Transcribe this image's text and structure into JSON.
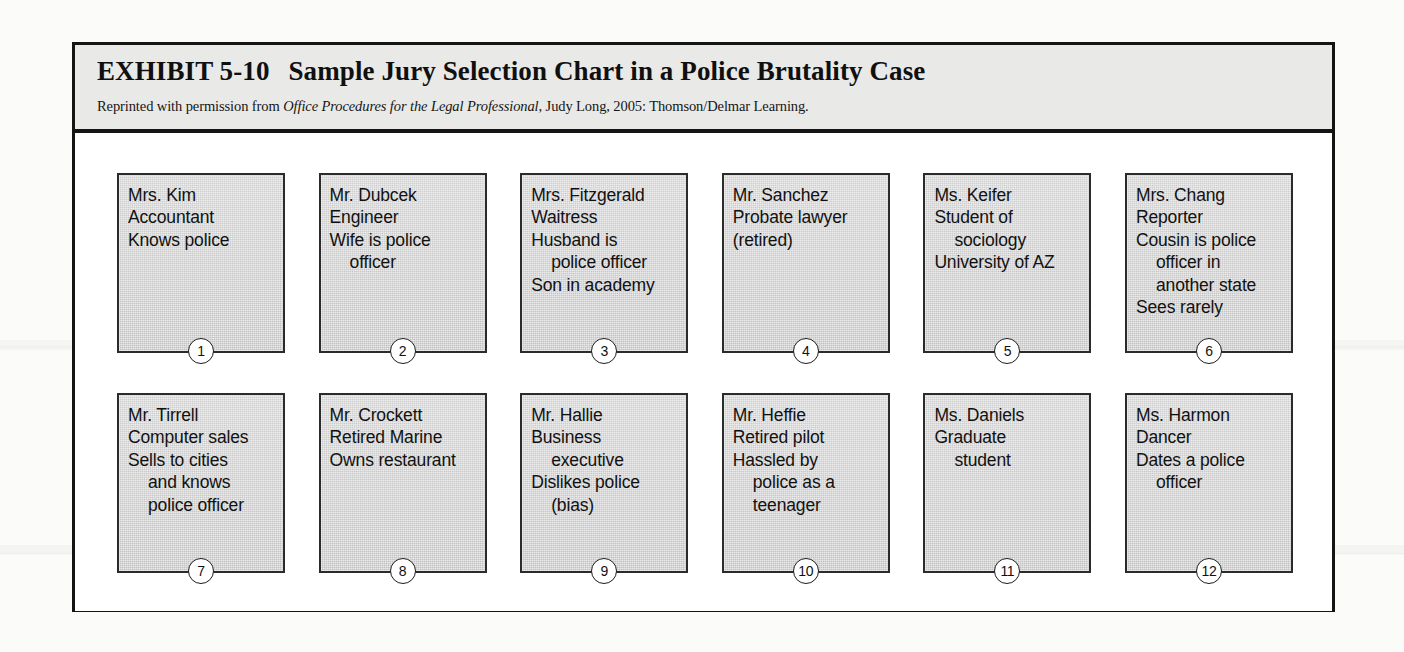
{
  "page": {
    "background_color": "#fbfbfa",
    "frame_color": "#141414"
  },
  "header": {
    "exhibit_number": "EXHIBIT 5-10",
    "title": "Sample Jury Selection Chart in a Police Brutality Case",
    "credit_prefix": "Reprinted with permission from ",
    "credit_book_title": "Office Procedures for the Legal Professional",
    "credit_suffix": ", Judy Long, 2005: Thomson/Delmar Learning.",
    "background_color": "#e9e9e7"
  },
  "chart_data": {
    "type": "table",
    "title": "Sample Jury Selection Chart in a Police Brutality Case",
    "layout": {
      "rows": 2,
      "columns": 6,
      "seat_count": 12
    },
    "cards": [
      {
        "number": "1",
        "lines": [
          {
            "text": "Mrs. Kim",
            "indent": false
          },
          {
            "text": "Accountant",
            "indent": false
          },
          {
            "text": "Knows police",
            "indent": false
          }
        ]
      },
      {
        "number": "2",
        "lines": [
          {
            "text": "Mr. Dubcek",
            "indent": false
          },
          {
            "text": "Engineer",
            "indent": false
          },
          {
            "text": "Wife is police",
            "indent": false
          },
          {
            "text": "officer",
            "indent": true
          }
        ]
      },
      {
        "number": "3",
        "lines": [
          {
            "text": "Mrs. Fitzgerald",
            "indent": false
          },
          {
            "text": "Waitress",
            "indent": false
          },
          {
            "text": "Husband is",
            "indent": false
          },
          {
            "text": "police officer",
            "indent": true
          },
          {
            "text": "Son in academy",
            "indent": false
          }
        ]
      },
      {
        "number": "4",
        "lines": [
          {
            "text": "Mr. Sanchez",
            "indent": false
          },
          {
            "text": "Probate lawyer",
            "indent": false
          },
          {
            "text": "(retired)",
            "indent": false
          }
        ]
      },
      {
        "number": "5",
        "lines": [
          {
            "text": "Ms. Keifer",
            "indent": false
          },
          {
            "text": "Student of",
            "indent": false
          },
          {
            "text": "sociology",
            "indent": true
          },
          {
            "text": "University of AZ",
            "indent": false
          }
        ]
      },
      {
        "number": "6",
        "lines": [
          {
            "text": "Mrs. Chang",
            "indent": false
          },
          {
            "text": "Reporter",
            "indent": false
          },
          {
            "text": "Cousin is police",
            "indent": false
          },
          {
            "text": "officer in",
            "indent": true
          },
          {
            "text": "another state",
            "indent": true
          },
          {
            "text": "Sees rarely",
            "indent": false
          }
        ]
      },
      {
        "number": "7",
        "lines": [
          {
            "text": "Mr. Tirrell",
            "indent": false
          },
          {
            "text": "Computer sales",
            "indent": false
          },
          {
            "text": "Sells to cities",
            "indent": false
          },
          {
            "text": "and knows",
            "indent": true
          },
          {
            "text": "police officer",
            "indent": true
          }
        ]
      },
      {
        "number": "8",
        "lines": [
          {
            "text": "Mr. Crockett",
            "indent": false
          },
          {
            "text": "Retired Marine",
            "indent": false
          },
          {
            "text": "Owns restaurant",
            "indent": false
          }
        ]
      },
      {
        "number": "9",
        "lines": [
          {
            "text": "Mr. Hallie",
            "indent": false
          },
          {
            "text": "Business",
            "indent": false
          },
          {
            "text": "executive",
            "indent": true
          },
          {
            "text": "Dislikes police",
            "indent": false
          },
          {
            "text": "(bias)",
            "indent": true
          }
        ]
      },
      {
        "number": "10",
        "lines": [
          {
            "text": "Mr. Heffie",
            "indent": false
          },
          {
            "text": "Retired pilot",
            "indent": false
          },
          {
            "text": "Hassled by",
            "indent": false
          },
          {
            "text": "police as a",
            "indent": true
          },
          {
            "text": "teenager",
            "indent": true
          }
        ]
      },
      {
        "number": "11",
        "lines": [
          {
            "text": "Ms. Daniels",
            "indent": false
          },
          {
            "text": "Graduate",
            "indent": false
          },
          {
            "text": "student",
            "indent": true
          }
        ]
      },
      {
        "number": "12",
        "lines": [
          {
            "text": "Ms. Harmon",
            "indent": false
          },
          {
            "text": "Dancer",
            "indent": false
          },
          {
            "text": "Dates a police",
            "indent": false
          },
          {
            "text": "officer",
            "indent": true
          }
        ]
      }
    ]
  }
}
